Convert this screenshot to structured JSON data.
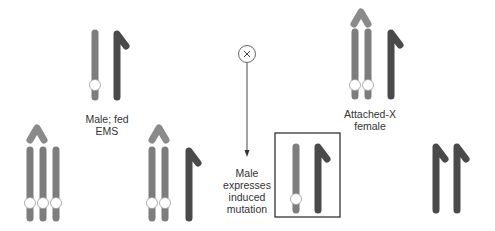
{
  "colors": {
    "light_chromosome": "#7d7d7d",
    "dark_chromosome": "#4a4a4a",
    "attachment_caret": "#8a8a8a",
    "marker_fill": "#ffffff",
    "line": "#333333"
  },
  "labels": {
    "male_fed": [
      "Male; fed",
      "EMS"
    ],
    "cross_symbol": "×",
    "attached_x_female": [
      "Attached-X",
      "female"
    ],
    "male_expresses": [
      "Male",
      "expresses",
      "induced",
      "mutation"
    ]
  },
  "groups": [
    {
      "id": "male-fed-ems",
      "karyotype": "X* Y",
      "light": 1,
      "dark": 1,
      "marked": 1,
      "attached": false
    },
    {
      "id": "attached-x-female",
      "karyotype": "X^X Y",
      "light": 2,
      "dark": 1,
      "marked": 2,
      "attached": true
    },
    {
      "id": "triple-x-progeny",
      "karyotype": "X^X X*",
      "light": 3,
      "dark": 0,
      "marked": 3,
      "attached": true
    },
    {
      "id": "attached-x-female-progeny",
      "karyotype": "X^X Y",
      "light": 2,
      "dark": 1,
      "marked": 2,
      "attached": true
    },
    {
      "id": "male-progeny-boxed",
      "karyotype": "X* Y",
      "light": 1,
      "dark": 1,
      "marked": 1,
      "attached": false,
      "highlighted": true
    },
    {
      "id": "yy-progeny",
      "karyotype": "Y Y",
      "light": 0,
      "dark": 2,
      "marked": 0,
      "attached": false
    }
  ]
}
